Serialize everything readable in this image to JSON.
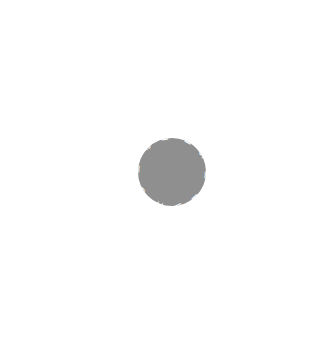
{
  "diagram": {
    "type": "flower",
    "center": {
      "x": 172,
      "y": 172
    },
    "petal_color": "#8f8f8f",
    "label_color": "#ffffff",
    "petals": [
      {
        "label": "Growth and healing",
        "angle": -100,
        "length": 148
      },
      {
        "label": "Reduced fear",
        "angle": -62,
        "length": 150
      },
      {
        "label": "Social interaction",
        "angle": -30,
        "length": 145
      },
      {
        "label": "Interpret emotions",
        "angle": 5,
        "length": 140
      },
      {
        "label": "Recognition and bonding",
        "angle": 48,
        "length": 140
      },
      {
        "label": "Well-being",
        "angle": 80,
        "length": 155
      },
      {
        "label": "Calm and trust",
        "angle": 112,
        "length": 140
      },
      {
        "label": "Reduced pain",
        "angle": 150,
        "length": 140
      },
      {
        "label": "Reduced stress level",
        "angle": 185,
        "length": 140
      },
      {
        "label": "Lowered pulse and blood pressure",
        "angle": 227,
        "length": 150
      }
    ]
  }
}
